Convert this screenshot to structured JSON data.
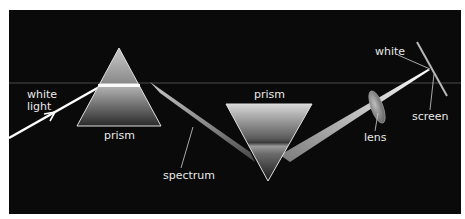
{
  "diagram": {
    "colors": {
      "background": "#0a0a0a",
      "page": "#ffffff",
      "label_text": "#e8e8e8",
      "beam": "#ffffff",
      "guide_line": "#5a5a5a"
    },
    "labels": {
      "white_light": [
        "white",
        "light"
      ],
      "prism_1": "prism",
      "prism_2": "prism",
      "spectrum": "spectrum",
      "lens": "lens",
      "white": "white",
      "screen": "screen"
    },
    "elements": [
      {
        "id": "white-light-beam",
        "type": "arrow",
        "description": "incoming white light ray"
      },
      {
        "id": "prism-1",
        "type": "triangle",
        "orientation": "upright"
      },
      {
        "id": "spectrum-band",
        "type": "beam",
        "description": "dispersed spectrum between prisms"
      },
      {
        "id": "prism-2",
        "type": "triangle",
        "orientation": "inverted"
      },
      {
        "id": "recombined-beam",
        "type": "beam"
      },
      {
        "id": "lens",
        "type": "ellipse"
      },
      {
        "id": "screen",
        "type": "line"
      }
    ]
  }
}
